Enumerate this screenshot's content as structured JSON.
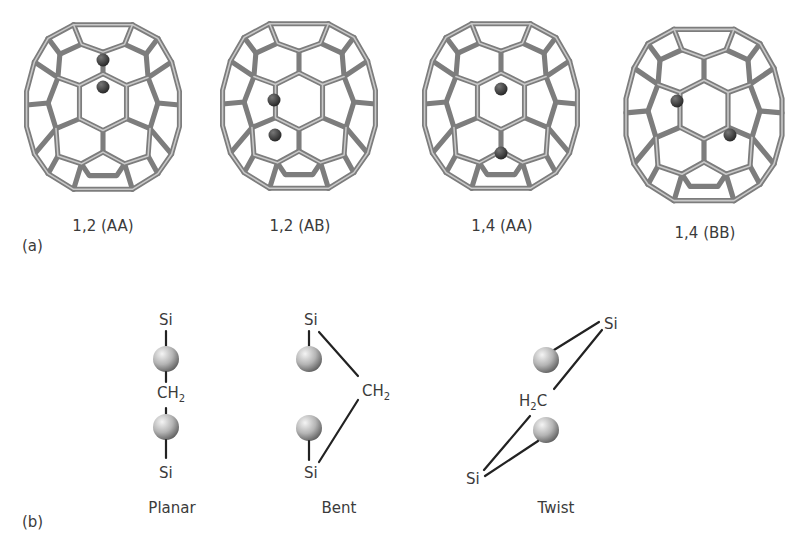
{
  "figure": {
    "panel_a": {
      "label": "(a)",
      "cages": [
        {
          "label": "1,2 (AA)",
          "dopant_positions": "adjacent, top center"
        },
        {
          "label": "1,2 (AB)",
          "dopant_positions": "adjacent, left of center"
        },
        {
          "label": "1,4 (AA)",
          "dopant_positions": "para, vertical center"
        },
        {
          "label": "1,4 (BB)",
          "dopant_positions": "para, diagonal"
        }
      ]
    },
    "panel_b": {
      "label": "(b)",
      "configurations": [
        {
          "name": "Planar",
          "atoms": {
            "top": "Si",
            "middle": "CH",
            "middle_sub": "2",
            "bottom": "Si"
          }
        },
        {
          "name": "Bent",
          "atoms": {
            "top": "Si",
            "middle": "CH",
            "middle_sub": "2",
            "bottom": "Si"
          }
        },
        {
          "name": "Twist",
          "atoms": {
            "top": "Si",
            "middle_pre": "H",
            "middle_sub": "2",
            "middle_post": "C",
            "bottom": "Si"
          }
        }
      ]
    },
    "colors": {
      "cage_bond": "#7d7d7d",
      "dopant_atom": "#3a3a3a",
      "sphere_light": "#f2f2f2",
      "sphere_dark": "#6e6e6e",
      "line": "#222222",
      "text": "#3b3b3b"
    }
  }
}
